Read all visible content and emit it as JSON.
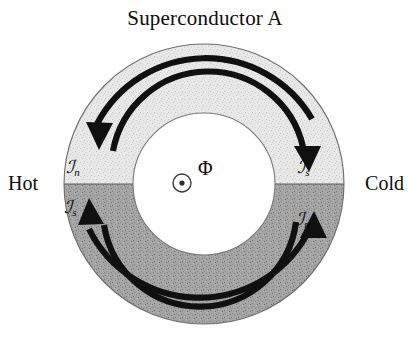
{
  "title": "Superconductor A",
  "labels": {
    "hot": "Hot",
    "cold": "Cold",
    "flux": "Φ"
  },
  "currents": [
    {
      "id": "jn-top",
      "symbol": "ℐ",
      "sub": "n",
      "quadrant": "top-left",
      "direction": "counterclockwise-to-left"
    },
    {
      "id": "js-top",
      "symbol": "ℐ",
      "sub": "s",
      "quadrant": "top-right",
      "direction": "clockwise-to-right"
    },
    {
      "id": "js-bot",
      "symbol": "ℐ",
      "sub": "s",
      "quadrant": "bottom-left",
      "direction": "upward-to-left"
    },
    {
      "id": "jn-bot",
      "symbol": "ℐ",
      "sub": "n",
      "quadrant": "bottom-right",
      "direction": "upward-to-right"
    }
  ],
  "geometry": {
    "center_x": 204,
    "center_y": 184,
    "outer_radius": 140,
    "inner_radius": 71,
    "divider_y": 184
  },
  "colors": {
    "hot_half": "#e2e2e2",
    "cold_half": "#9a9a9a",
    "stroke": "#111111",
    "text": "#0d0d0d",
    "background": "#ffffff"
  }
}
